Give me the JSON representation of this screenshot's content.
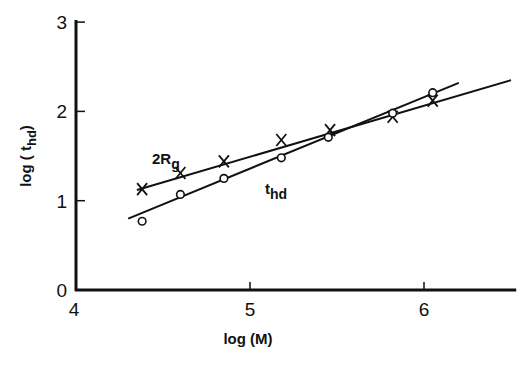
{
  "chart_data": {
    "type": "scatter",
    "title": "",
    "xlabel": "log (M)",
    "ylabel": "log (t_hd)",
    "xlim": [
      4,
      6.5
    ],
    "ylim": [
      0,
      3
    ],
    "x_ticks": [
      "4",
      "5",
      "6"
    ],
    "y_ticks": [
      "0",
      "1",
      "2",
      "3"
    ],
    "grid": false,
    "legend": "inline labels",
    "series": [
      {
        "name": "2Rg",
        "marker": "x",
        "x": [
          4.38,
          4.6,
          4.85,
          5.18,
          5.46,
          5.82,
          6.05
        ],
        "y": [
          1.13,
          1.31,
          1.44,
          1.68,
          1.79,
          1.94,
          2.12
        ],
        "fit_line": [
          [
            4.35,
            1.12
          ],
          [
            6.5,
            2.35
          ]
        ]
      },
      {
        "name": "t_hd",
        "marker": "o",
        "x": [
          4.38,
          4.6,
          4.85,
          5.18,
          5.45,
          5.82,
          6.05
        ],
        "y": [
          0.77,
          1.07,
          1.25,
          1.48,
          1.71,
          1.98,
          2.21
        ],
        "fit_line": [
          [
            4.3,
            0.8
          ],
          [
            6.2,
            2.32
          ]
        ]
      }
    ],
    "annotations": [
      {
        "text": "2R",
        "sub": "g",
        "x": 4.6,
        "y": 1.55
      },
      {
        "text": "t",
        "sub": "hd",
        "x": 5.05,
        "y": 1.25
      }
    ]
  },
  "labels": {
    "xlabel": "log  (M)",
    "ylabel_main": "log ( t",
    "ylabel_sub": "hd",
    "ylabel_close": ")",
    "series1_main": "2R",
    "series1_sub": "g",
    "series2_main": "t",
    "series2_sub": "hd"
  }
}
